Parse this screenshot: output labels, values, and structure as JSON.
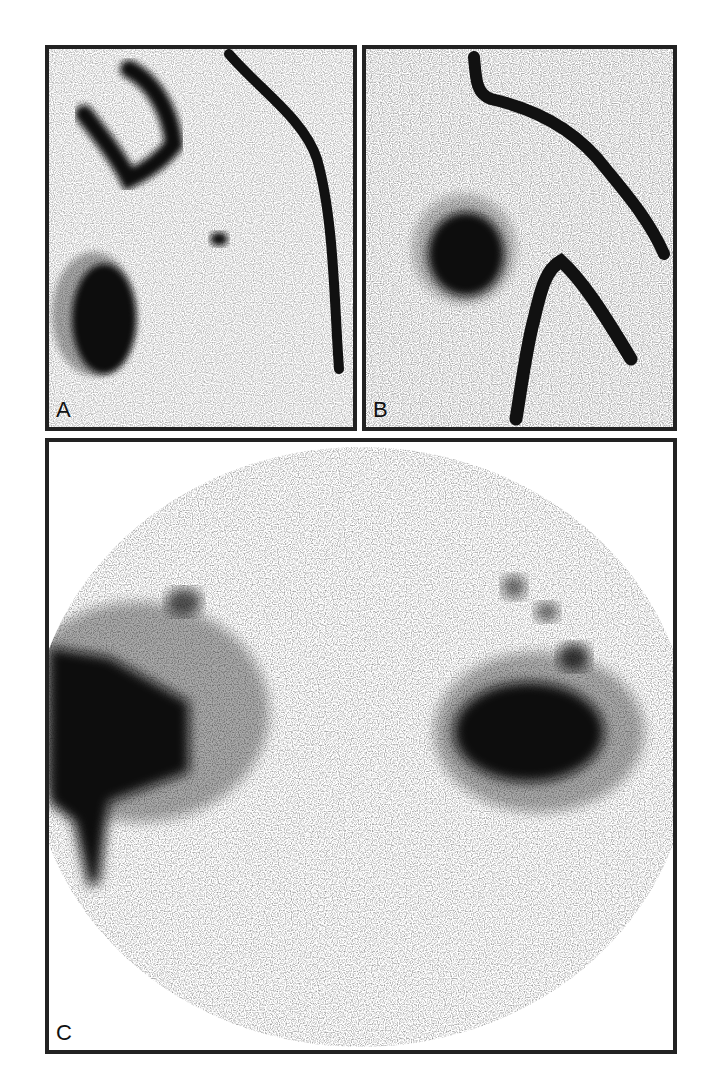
{
  "figure": {
    "panels": [
      {
        "id": "A",
        "label": "A",
        "description": "scintigraphic image with dark curved band, hook-shaped uptake, small focal spot and large dark oval focus"
      },
      {
        "id": "B",
        "label": "B",
        "description": "scintigraphic image with dark round focus and two dark curved bands"
      },
      {
        "id": "C",
        "label": "C",
        "description": "circular field scintigraphic image with two large dark uptake regions and scattered speckle"
      }
    ],
    "colors": {
      "border": "#222222",
      "uptake": "#111111",
      "background": "#ffffff"
    }
  }
}
